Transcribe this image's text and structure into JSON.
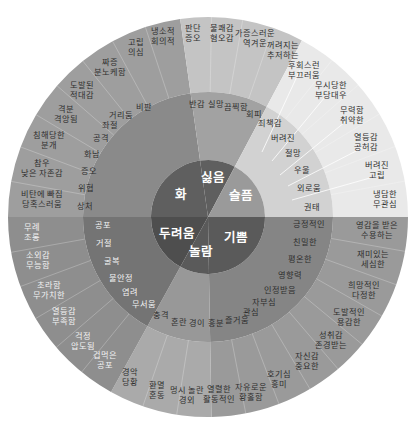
{
  "geometry": {
    "cx": 208,
    "cy": 217,
    "r_outer": 200,
    "r_mid": 125,
    "r_inner": 57
  },
  "colors": {
    "anger_outer": "#9e9e9e",
    "anger_mid": "#8a8a8a",
    "core_anger": "#5f5f5f",
    "disgust_outer": "#c4c4c4",
    "disgust_mid": "#a2a2a2",
    "core_disgust": "#5f5f5f",
    "sadness_outer": "#e9e9e9",
    "sadness_mid": "#d2d2d2",
    "core_sadness": "#9a9a9a",
    "joy_outer": "#9a9a9a",
    "joy_mid": "#858585",
    "core_joy": "#5a5a5a",
    "surprise_outer": "#aaaaaa",
    "surprise_mid": "#989898",
    "core_surprise": "#5a5a5a",
    "fear_outer": "#8e8e8e",
    "fear_mid": "#747474",
    "core_fear": "#4e4e4e"
  },
  "chart_data": {
    "type": "sunburst",
    "title": "",
    "levels": 3,
    "core": [
      {
        "name": "화",
        "start": 180,
        "end": 262
      },
      {
        "name": "싫음",
        "start": 262,
        "end": 298
      },
      {
        "name": "슬픔",
        "start": 298,
        "end": 360
      },
      {
        "name": "기쁨",
        "start": 0,
        "end": 89
      },
      {
        "name": "놀람",
        "start": 89,
        "end": 119
      },
      {
        "name": "두려움",
        "start": 119,
        "end": 180
      }
    ],
    "middle": {
      "화": [
        "상처",
        "위협",
        "증오",
        "화남",
        "공격",
        "좌절",
        "거리둠",
        "비판"
      ],
      "싫음": [
        "반감",
        "실망",
        "끔찍함",
        "회피"
      ],
      "슬픔": [
        "죄책감",
        "버려진",
        "절망",
        "우울",
        "외로움",
        "권태"
      ],
      "기쁨": [
        "긍정적인",
        "친밀한",
        "평온한",
        "영향력",
        "인정받음",
        "자부심",
        "관심",
        "즐거움"
      ],
      "놀람": [
        "흥분",
        "경이",
        "혼란",
        "충격"
      ],
      "두려움": [
        "공포",
        "거절",
        "굴복",
        "불안정",
        "염려",
        "무서움"
      ]
    },
    "outer": {
      "화": [
        "비탄에 빠짐 / 당혹스러움",
        "참우 / 낮은 자존감",
        "침해당한 / 분개",
        "격분 / 격앙됨",
        "도발된 / 적대감",
        "짜증 / 분노케함",
        "고립 / 의심",
        "냉소적 / 회의적"
      ],
      "싫음": [
        "판단 / 증오",
        "불쾌감 / 혐오감",
        "가증스러운 / 역겨운",
        "꺼려지는 / 주저하는"
      ],
      "슬픔": [
        "후회스런 / 부끄러움",
        "무시당한 / 부당대우",
        "무력함 / 취약한",
        "열등감 / 공허감",
        "버려진 / 고립",
        "냉담한 / 무관심"
      ],
      "기쁨": [
        "영감을 받은 / 수용하는",
        "재미있는 / 세심한",
        "희망적인 / 다정한",
        "도발적인 / 용감한",
        "성취감 / 존경받는",
        "자신감 / 중요한",
        "호기심 / 흥미",
        "자유로운 / 황홀함",
        "열렬한 / 활동적인"
      ],
      "놀람": [
        "멍시 놀란 / 경외",
        "환멸 / 혼동",
        "경악 / 당황"
      ],
      "두려움": [
        "겁먹은 / 공포",
        "걱정 / 압도됨",
        "열등감 / 부족함",
        "초라함 / 무가치한",
        "소외감 / 무능함",
        "무례 / 조롱"
      ]
    }
  },
  "labels": {
    "core": {
      "anger": "화",
      "disgust": "싫음",
      "sadness": "슬픔",
      "joy": "기쁨",
      "surprise": "놀람",
      "fear": "두려움"
    },
    "middle": [
      {
        "t": "비판",
        "x": 144,
        "y": 110
      },
      {
        "t": "거리둠",
        "x": 121,
        "y": 118
      },
      {
        "t": "좌절",
        "x": 110,
        "y": 128
      },
      {
        "t": "공격",
        "x": 101,
        "y": 141
      },
      {
        "t": "화남",
        "x": 92,
        "y": 157
      },
      {
        "t": "증오",
        "x": 89,
        "y": 174
      },
      {
        "t": "위협",
        "x": 86,
        "y": 191
      },
      {
        "t": "상처",
        "x": 85,
        "y": 209
      },
      {
        "t": "반감",
        "x": 197,
        "y": 107
      },
      {
        "t": "실망",
        "x": 216,
        "y": 107
      },
      {
        "t": "끔찍함",
        "x": 236,
        "y": 110
      },
      {
        "t": "회피",
        "x": 254,
        "y": 117
      },
      {
        "t": "죄책감",
        "x": 270,
        "y": 126
      },
      {
        "t": "버려진",
        "x": 283,
        "y": 141
      },
      {
        "t": "절망",
        "x": 293,
        "y": 156
      },
      {
        "t": "우울",
        "x": 302,
        "y": 173
      },
      {
        "t": "외로움",
        "x": 309,
        "y": 191
      },
      {
        "t": "권태",
        "x": 312,
        "y": 210
      },
      {
        "t": "긍정적인",
        "x": 309,
        "y": 227
      },
      {
        "t": "친밀한",
        "x": 305,
        "y": 245
      },
      {
        "t": "평온한",
        "x": 300,
        "y": 262
      },
      {
        "t": "영향력",
        "x": 290,
        "y": 278
      },
      {
        "t": "인정받음",
        "x": 280,
        "y": 293
      },
      {
        "t": "자부심",
        "x": 264,
        "y": 305
      },
      {
        "t": "관심",
        "x": 251,
        "y": 315
      },
      {
        "t": "즐거움",
        "x": 237,
        "y": 323
      },
      {
        "t": "흥분",
        "x": 216,
        "y": 326
      },
      {
        "t": "경이",
        "x": 197,
        "y": 326
      },
      {
        "t": "혼란",
        "x": 179,
        "y": 325
      },
      {
        "t": "충격",
        "x": 161,
        "y": 318
      },
      {
        "t": "무서움",
        "x": 144,
        "y": 307,
        "light": true
      },
      {
        "t": "염려",
        "x": 130,
        "y": 295,
        "light": true
      },
      {
        "t": "불안정",
        "x": 121,
        "y": 281,
        "light": true
      },
      {
        "t": "굴복",
        "x": 112,
        "y": 264,
        "light": true
      },
      {
        "t": "거절",
        "x": 104,
        "y": 246,
        "light": true
      },
      {
        "t": "공포",
        "x": 103,
        "y": 228,
        "light": true
      }
    ],
    "outer": [
      {
        "a": "냉소적",
        "b": "회의적",
        "x": 163,
        "y": 34
      },
      {
        "a": "고립",
        "b": "의심",
        "x": 136,
        "y": 45
      },
      {
        "a": "짜증",
        "b": "분노케함",
        "x": 110,
        "y": 65
      },
      {
        "a": "도발된",
        "b": "적대감",
        "x": 82,
        "y": 88
      },
      {
        "a": "격분",
        "b": "격앙됨",
        "x": 66,
        "y": 112
      },
      {
        "a": "침해당한",
        "b": "분개",
        "x": 49,
        "y": 138
      },
      {
        "a": "참우",
        "b": "낮은 자존감",
        "x": 42,
        "y": 166
      },
      {
        "a": "비탄에 빠짐",
        "b": "당혹스러움",
        "x": 42,
        "y": 197
      },
      {
        "a": "판단",
        "b": "증오",
        "x": 193,
        "y": 31
      },
      {
        "a": "불쾌감",
        "b": "혐오감",
        "x": 222,
        "y": 31
      },
      {
        "a": "가증스러운",
        "b": "역겨운",
        "x": 255,
        "y": 36
      },
      {
        "a": "꺼려지는",
        "b": "추저하는",
        "x": 283,
        "y": 48
      },
      {
        "a": "후회스런",
        "b": "부끄러움",
        "x": 304,
        "y": 68
      },
      {
        "a": "무시당한",
        "b": "부당대우",
        "x": 331,
        "y": 88
      },
      {
        "a": "무력함",
        "b": "취약한",
        "x": 352,
        "y": 113
      },
      {
        "a": "열등감",
        "b": "공허감",
        "x": 366,
        "y": 140
      },
      {
        "a": "버려진",
        "b": "고립",
        "x": 377,
        "y": 168
      },
      {
        "a": "냉담한",
        "b": "무관심",
        "x": 385,
        "y": 197
      },
      {
        "a": "영감을 받은",
        "b": "수용하는",
        "x": 377,
        "y": 228
      },
      {
        "a": "재미있는",
        "b": "세심한",
        "x": 373,
        "y": 257
      },
      {
        "a": "희망적인",
        "b": "다정한",
        "x": 364,
        "y": 288
      },
      {
        "a": "도발적인",
        "b": "용감한",
        "x": 349,
        "y": 315
      },
      {
        "a": "성취감",
        "b": "존경받는",
        "x": 331,
        "y": 338
      },
      {
        "a": "자신감",
        "b": "중요한",
        "x": 307,
        "y": 359
      },
      {
        "a": "호기심",
        "b": "흥미",
        "x": 279,
        "y": 377
      },
      {
        "a": "자유로운",
        "b": "황홀함",
        "x": 251,
        "y": 390
      },
      {
        "a": "열렬한",
        "b": "활동적인",
        "x": 219,
        "y": 392
      },
      {
        "a": "멍시 놀란",
        "b": "경외",
        "x": 187,
        "y": 393
      },
      {
        "a": "환멸",
        "b": "혼동",
        "x": 157,
        "y": 388
      },
      {
        "a": "경악",
        "b": "당황",
        "x": 130,
        "y": 375
      },
      {
        "a": "겁먹은",
        "b": "공포",
        "x": 105,
        "y": 358,
        "light": true
      },
      {
        "a": "걱정",
        "b": "압도됨",
        "x": 83,
        "y": 339,
        "light": true
      },
      {
        "a": "열등감",
        "b": "부족함",
        "x": 64,
        "y": 314,
        "light": true
      },
      {
        "a": "초라함",
        "b": "무가치한",
        "x": 49,
        "y": 288,
        "light": true
      },
      {
        "a": "소외감",
        "b": "무능함",
        "x": 38,
        "y": 258,
        "light": true
      },
      {
        "a": "무례",
        "b": "조롱",
        "x": 32,
        "y": 230,
        "light": true
      }
    ]
  }
}
